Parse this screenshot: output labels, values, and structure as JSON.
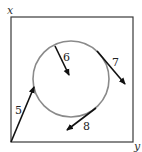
{
  "diagram": {
    "axes": {
      "x_label": "x",
      "y_label": "y"
    },
    "box": {
      "x": 11,
      "y": 17,
      "width": 122,
      "height": 125,
      "stroke": "#3a3a3a"
    },
    "circle": {
      "cx": 71,
      "cy": 79,
      "r": 38,
      "stroke": "#8a8a8a"
    },
    "arrows": [
      {
        "label": "5",
        "x1": 11,
        "y1": 142,
        "x2": 34,
        "y2": 87,
        "label_x": 16,
        "label_y": 112
      },
      {
        "label": "6",
        "x1": 55,
        "y1": 46,
        "x2": 69,
        "y2": 75,
        "label_x": 63,
        "label_y": 61
      },
      {
        "label": "7",
        "x1": 97,
        "y1": 51,
        "x2": 125,
        "y2": 84,
        "label_x": 113,
        "label_y": 65
      },
      {
        "label": "8",
        "x1": 96,
        "y1": 108,
        "x2": 66,
        "y2": 130,
        "label_x": 83,
        "label_y": 129
      }
    ],
    "arrow_color": "#111111"
  }
}
